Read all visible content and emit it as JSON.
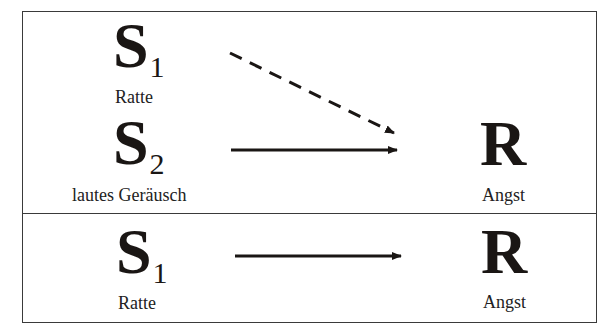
{
  "diagram": {
    "type": "classical-conditioning",
    "colors": {
      "ink": "#1a1614",
      "border": "#3a3a3a",
      "background": "#ffffff"
    },
    "top_panel": {
      "stimulus_1": {
        "letter": "S",
        "subscript": "1",
        "label": "Ratte"
      },
      "stimulus_2": {
        "letter": "S",
        "subscript": "2",
        "label": "lautes Geräusch"
      },
      "response": {
        "letter": "R",
        "label": "Angst"
      },
      "arrows": [
        {
          "from": "S1",
          "to": "R",
          "style": "dashed"
        },
        {
          "from": "S2",
          "to": "R",
          "style": "solid"
        }
      ]
    },
    "bottom_panel": {
      "stimulus_1": {
        "letter": "S",
        "subscript": "1",
        "label": "Ratte"
      },
      "response": {
        "letter": "R",
        "label": "Angst"
      },
      "arrows": [
        {
          "from": "S1",
          "to": "R",
          "style": "solid"
        }
      ]
    }
  }
}
